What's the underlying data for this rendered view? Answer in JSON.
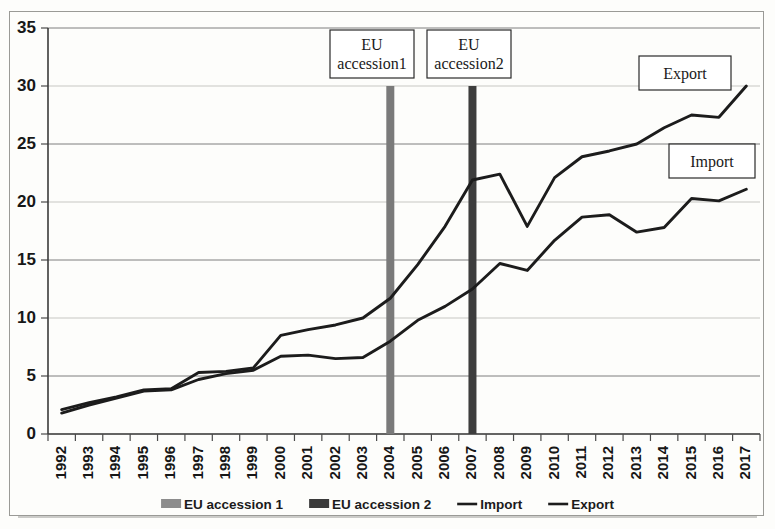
{
  "chart_data": {
    "type": "line",
    "title": "",
    "xlabel": "",
    "ylabel": "",
    "ylim": [
      0,
      35
    ],
    "ytick_step": 5,
    "yticks": [
      "0",
      "5",
      "10",
      "15",
      "20",
      "25",
      "30",
      "35"
    ],
    "grid": true,
    "legend_position": "bottom",
    "categories": [
      "1992",
      "1993",
      "1994",
      "1995",
      "1996",
      "1997",
      "1998",
      "1999",
      "2000",
      "2001",
      "2002",
      "2003",
      "2004",
      "2005",
      "2006",
      "2007",
      "2008",
      "2009",
      "2010",
      "2011",
      "2012",
      "2013",
      "2014",
      "2015",
      "2016",
      "2017"
    ],
    "series": [
      {
        "name": "Export",
        "values": [
          2.1,
          2.7,
          3.2,
          3.8,
          3.9,
          5.3,
          5.4,
          5.7,
          8.5,
          9.0,
          9.4,
          10.0,
          11.7,
          14.6,
          17.9,
          21.9,
          22.4,
          17.9,
          22.1,
          23.9,
          24.4,
          25.0,
          26.4,
          27.5,
          27.3,
          30.0
        ]
      },
      {
        "name": "Import",
        "values": [
          1.8,
          2.5,
          3.1,
          3.7,
          3.8,
          4.7,
          5.2,
          5.5,
          6.7,
          6.8,
          6.5,
          6.6,
          8.0,
          9.8,
          11.0,
          12.5,
          14.7,
          14.1,
          16.7,
          18.7,
          18.9,
          17.4,
          17.8,
          20.3,
          20.1,
          21.1
        ]
      }
    ],
    "markers": [
      {
        "name": "EU accession 1",
        "year": "2004",
        "value": 30,
        "color": "#7a7a7a"
      },
      {
        "name": "EU accession 2",
        "year": "2007",
        "value": 30,
        "color": "#3d3d3d"
      }
    ],
    "annotations": [
      {
        "id": "accession1",
        "line1": "EU",
        "line2": "accession1"
      },
      {
        "id": "accession2",
        "line1": "EU",
        "line2": "accession2"
      },
      {
        "id": "export",
        "line1": "Export",
        "line2": ""
      },
      {
        "id": "import",
        "line1": "Import",
        "line2": ""
      }
    ],
    "legend": [
      {
        "label": "EU accession 1",
        "type": "swatch",
        "color": "#8c8c8c"
      },
      {
        "label": "EU accession 2",
        "type": "swatch",
        "color": "#3a3a3a"
      },
      {
        "label": "Import",
        "type": "line",
        "color": "#1c1c1c"
      },
      {
        "label": "Export",
        "type": "line",
        "color": "#1c1c1c"
      }
    ]
  }
}
